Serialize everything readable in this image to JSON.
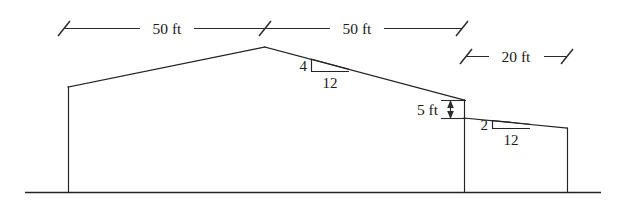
{
  "figure": {
    "ink_color": "#232323",
    "background_color": "#ffffff"
  },
  "dimensions": {
    "span_left": {
      "label": "50 ft",
      "value": 50,
      "unit": "ft",
      "orientation": "horizontal"
    },
    "span_right": {
      "label": "50 ft",
      "value": 50,
      "unit": "ft",
      "orientation": "horizontal"
    },
    "lean_to_span": {
      "label": "20 ft",
      "value": 20,
      "unit": "ft",
      "orientation": "horizontal"
    },
    "wall_offset": {
      "label": "5 ft",
      "value": 5,
      "unit": "ft",
      "orientation": "vertical"
    }
  },
  "slopes": {
    "main_roof": {
      "rise_label": "4",
      "run_label": "12",
      "rise": 4,
      "run": 12,
      "name": "main-roof-slope-4-in-12"
    },
    "lean_to_roof": {
      "rise_label": "2",
      "run_label": "12",
      "rise": 2,
      "run": 12,
      "name": "lean-to-roof-slope-2-in-12"
    }
  },
  "geometry": {
    "ground_line": {
      "x1": 25,
      "x2": 601,
      "y": 192
    },
    "main_building": {
      "left_wall_top": {
        "x": 68,
        "y": 87
      },
      "left_wall_base": {
        "x": 68,
        "y": 192
      },
      "ridge": {
        "x": 265,
        "y": 47
      },
      "right_eave": {
        "x": 464,
        "y": 100
      },
      "right_wall_base": {
        "x": 464,
        "y": 192
      }
    },
    "lean_to": {
      "left_top": {
        "x": 464,
        "y": 118
      },
      "right_top": {
        "x": 567,
        "y": 128
      },
      "right_wall_base": {
        "x": 567,
        "y": 192
      }
    }
  }
}
